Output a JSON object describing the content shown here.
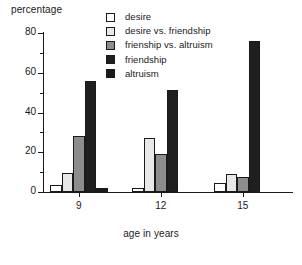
{
  "chart_data": {
    "type": "bar",
    "title": "",
    "ylabel": "percentage",
    "xlabel": "age in years",
    "categories": [
      "9",
      "12",
      "15"
    ],
    "ylim": [
      0,
      80
    ],
    "yticks": [
      0,
      20,
      40,
      60,
      80
    ],
    "ytick_labels": [
      "0",
      "20",
      "40",
      "60",
      "80"
    ],
    "yminor_ticks": [
      10,
      30,
      50,
      70
    ],
    "grid": false,
    "legend_position": "top-right",
    "series": [
      {
        "name": "desire",
        "color": "#ffffff",
        "values": [
          3.5,
          1.8,
          4.5
        ]
      },
      {
        "name": "desire vs. friendship",
        "color": "#e8e8e8",
        "values": [
          9.5,
          27.0,
          9.0
        ]
      },
      {
        "name": "frienship vs. altruism",
        "color": "#8d8d8d",
        "values": [
          28.0,
          19.0,
          7.5
        ]
      },
      {
        "name": "friendship",
        "color": "#1f1f1f",
        "values": [
          56.0,
          51.5,
          76.0
        ]
      },
      {
        "name": "altruism",
        "color": "#1a1a1a",
        "values": [
          2.0,
          0.0,
          0.0
        ]
      }
    ]
  },
  "legend": {
    "items": [
      {
        "label": "desire"
      },
      {
        "label": "desire vs. friendship"
      },
      {
        "label": "frienship vs. altruism"
      },
      {
        "label": "friendship"
      },
      {
        "label": "altruism"
      }
    ]
  }
}
